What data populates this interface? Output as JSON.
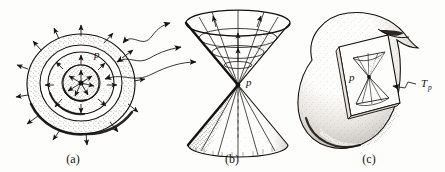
{
  "figure": {
    "background_color": "#fdfdfb",
    "ink_color": "#15120f",
    "width": 445,
    "height": 172
  },
  "panels": [
    {
      "id": "a",
      "caption": "(a)",
      "description": "Concentric expanding spherical wavefronts radiating outward from the point p, drawn as three stippled annular rings with outward-pointing arrowheads.",
      "point_label": "p",
      "ring_count": 3,
      "outward_arrow_count": 16,
      "inner_arrow_count": 7
    },
    {
      "id": "b",
      "caption": "(b)",
      "description": "The double light cone with apex at p; the upper (future) cone is drawn with radial generators and elliptical time-slice rings, the lower (past) cone opens downward.",
      "apex_label": "p",
      "upper_cone_generators": 8,
      "upper_cone_rings": 3,
      "lower_cone_generators": 7
    },
    {
      "id": "c",
      "caption": "(c)",
      "description": "A curved manifold drawn as a stippled blob with a folded notch; a tilted parallelogram tangent plane sits on it at p, containing a miniature double light cone.",
      "point_label": "p",
      "tangent_space_label": "T",
      "tangent_space_subscript": "p"
    }
  ],
  "connectors": {
    "description": "Three double-headed wavy arrows link the expanding wavefronts of panel (a) to the corresponding cone sections of panel (b).",
    "count": 3
  }
}
